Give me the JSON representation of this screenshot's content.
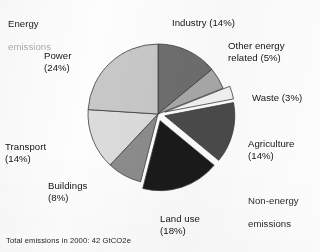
{
  "figure": {
    "footnote": "Total emissions in 2000: 42 GtCO2e",
    "group_energy_line1": "Energy",
    "group_energy_line2": "emissions",
    "group_nonenergy_line1": "Non-energy",
    "group_nonenergy_line2": "emissions"
  },
  "labels": {
    "power": "Power\n(24%)",
    "transport": "Transport\n(14%)",
    "buildings": "Buildings\n(8%)",
    "industry": "Industry (14%)",
    "other_energy_related": "Other energy\nrelated (5%)",
    "waste": "Waste (3%)",
    "agriculture": "Agriculture\n(14%)",
    "land_use": "Land use\n(18%)"
  },
  "colors": {
    "industry": "#6e6e6e",
    "other_energy_related": "#a8a8a8",
    "waste": "#f2f2f2",
    "agriculture": "#4a4a4a",
    "land_use": "#1a1a1a",
    "buildings": "#8c8c8c",
    "transport": "#dcdcdc",
    "power": "#c8c8c8",
    "outline": "#3c3c3c",
    "background": "#fdfdfd"
  },
  "chart_data": {
    "type": "pie",
    "title": "",
    "subtitle": "",
    "xlabel": "",
    "ylabel": "",
    "units": "percent of total emissions",
    "total_label": "Total emissions in 2000: 42 GtCO2e",
    "total_value": 42,
    "total_units": "GtCO2e",
    "total_year": 2000,
    "legend": "labels placed around the pie with leader-free direct annotation",
    "legend_position": "around",
    "grid": false,
    "start_angle_deg": 0,
    "direction": "clockwise",
    "exploded_group": "Non-energy emissions",
    "categories": [
      "Industry",
      "Other energy related",
      "Waste",
      "Agriculture",
      "Land use",
      "Buildings",
      "Transport",
      "Power"
    ],
    "values": [
      14,
      5,
      3,
      14,
      18,
      8,
      14,
      24
    ],
    "slices": [
      {
        "label": "Industry",
        "value": 14,
        "display": "Industry (14%)",
        "color": "#6e6e6e",
        "group": "Energy emissions",
        "exploded": false
      },
      {
        "label": "Other energy related",
        "value": 5,
        "display": "Other energy related (5%)",
        "color": "#a8a8a8",
        "group": "Energy emissions",
        "exploded": false
      },
      {
        "label": "Waste",
        "value": 3,
        "display": "Waste (3%)",
        "color": "#f2f2f2",
        "group": "Non-energy emissions",
        "exploded": true
      },
      {
        "label": "Agriculture",
        "value": 14,
        "display": "Agriculture (14%)",
        "color": "#4a4a4a",
        "group": "Non-energy emissions",
        "exploded": true
      },
      {
        "label": "Land use",
        "value": 18,
        "display": "Land use (18%)",
        "color": "#1a1a1a",
        "group": "Non-energy emissions",
        "exploded": true
      },
      {
        "label": "Buildings",
        "value": 8,
        "display": "Buildings (8%)",
        "color": "#8c8c8c",
        "group": "Energy emissions",
        "exploded": false
      },
      {
        "label": "Transport",
        "value": 14,
        "display": "Transport (14%)",
        "color": "#dcdcdc",
        "group": "Energy emissions",
        "exploded": false
      },
      {
        "label": "Power",
        "value": 24,
        "display": "Power (24%)",
        "color": "#c8c8c8",
        "group": "Energy emissions",
        "exploded": false
      }
    ],
    "groups": [
      {
        "name": "Energy emissions",
        "value": 65,
        "members": [
          "Industry",
          "Other energy related",
          "Buildings",
          "Transport",
          "Power"
        ]
      },
      {
        "name": "Non-energy emissions",
        "value": 35,
        "members": [
          "Waste",
          "Agriculture",
          "Land use"
        ]
      }
    ]
  }
}
